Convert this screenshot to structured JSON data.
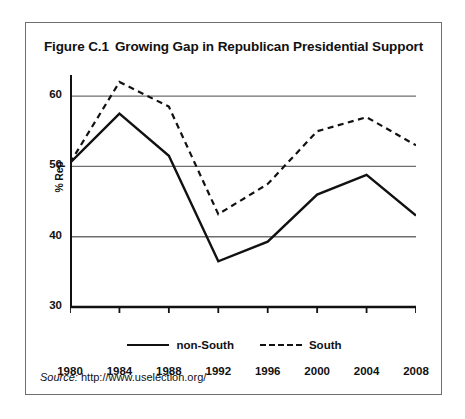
{
  "figure": {
    "number": "Figure C.1",
    "title": "Growing Gap in Republican Presidential Support",
    "source_label": "Source:",
    "source_url": "http://www.uselection.org/"
  },
  "legend": {
    "position": "bottom-center",
    "entries": [
      {
        "label": "non-South",
        "style": "solid"
      },
      {
        "label": "South",
        "style": "dashed"
      }
    ]
  },
  "chart_data": {
    "type": "line",
    "xlabel": "",
    "ylabel": "% Rep",
    "x": [
      1980,
      1984,
      1988,
      1992,
      1996,
      2000,
      2004,
      2008
    ],
    "xticklabels": [
      "1980",
      "1984",
      "1988",
      "1992",
      "1996",
      "2000",
      "2004",
      "2008"
    ],
    "yticks": [
      30,
      40,
      50,
      60
    ],
    "yticklabels": [
      "30",
      "40",
      "50",
      "60"
    ],
    "xlim": [
      1980,
      2008
    ],
    "ylim": [
      30,
      63
    ],
    "grid": "horizontal",
    "series": [
      {
        "name": "non-South",
        "style": "solid",
        "color": "#111111",
        "values": [
          50.5,
          57.5,
          51.5,
          36.5,
          39.3,
          46.0,
          48.8,
          43.0
        ]
      },
      {
        "name": "South",
        "style": "dashed",
        "color": "#111111",
        "values": [
          50.5,
          62.0,
          58.5,
          43.2,
          47.5,
          55.0,
          57.0,
          53.0
        ]
      }
    ]
  }
}
